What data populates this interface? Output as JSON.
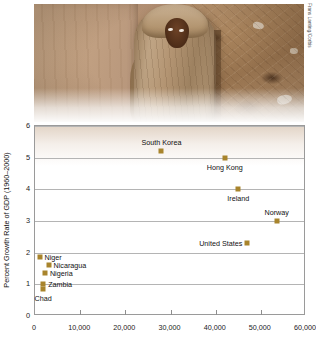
{
  "figure": {
    "photo": {
      "alt_desc": "child wrapped in blanket standing by mud wall",
      "credit": "Frans Lanting/Corbis"
    },
    "caption": ""
  },
  "chart_data": {
    "type": "scatter",
    "title": "",
    "xlabel": "",
    "ylabel": "Percent Growth Rate of GDP (1960–2000)",
    "xlim": [
      0,
      60000
    ],
    "ylim": [
      0,
      6
    ],
    "xticks": [
      "0",
      "10,000",
      "20,000",
      "30,000",
      "40,000",
      "50,000",
      "60,000"
    ],
    "xtick_values": [
      0,
      10000,
      20000,
      30000,
      40000,
      50000,
      60000
    ],
    "yticks": [
      "0",
      "1",
      "2",
      "3",
      "4",
      "5",
      "6"
    ],
    "ytick_values": [
      0,
      1,
      2,
      3,
      4,
      5,
      6
    ],
    "grid": true,
    "legend": false,
    "marker_color": "#a8842c",
    "points": [
      {
        "label": "South Korea",
        "x": 28000,
        "y": 5.2,
        "label_pos": "above"
      },
      {
        "label": "Hong Kong",
        "x": 42000,
        "y": 5.0,
        "label_pos": "below"
      },
      {
        "label": "Ireland",
        "x": 45000,
        "y": 4.0,
        "label_pos": "below"
      },
      {
        "label": "Norway",
        "x": 53500,
        "y": 3.0,
        "label_pos": "above"
      },
      {
        "label": "United States",
        "x": 47000,
        "y": 2.3,
        "label_pos": "left"
      },
      {
        "label": "Niger",
        "x": 1000,
        "y": 1.85,
        "label_pos": "right"
      },
      {
        "label": "Nicaragua",
        "x": 3000,
        "y": 1.6,
        "label_pos": "right"
      },
      {
        "label": "Nigeria",
        "x": 2200,
        "y": 1.35,
        "label_pos": "right"
      },
      {
        "label": "Zambia",
        "x": 1800,
        "y": 1.0,
        "label_pos": "right"
      },
      {
        "label": "Chad",
        "x": 1800,
        "y": 0.85,
        "label_pos": "below"
      }
    ]
  }
}
